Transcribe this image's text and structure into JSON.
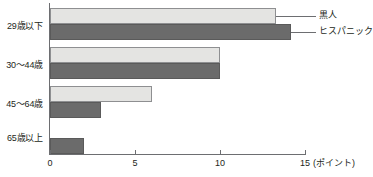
{
  "chart_data": {
    "type": "bar",
    "orientation": "horizontal",
    "title": "",
    "subtitle": "",
    "xlabel": "(ポイント)",
    "ylabel": "",
    "categories": [
      "29歳以下",
      "30～44歳",
      "45～64歳",
      "65歳以上"
    ],
    "series": [
      {
        "name": "黒人",
        "color": "#e4e4e2",
        "values": [
          13.3,
          10,
          6,
          0
        ]
      },
      {
        "name": "ヒスパニック",
        "color": "#6b6b6b",
        "values": [
          14.2,
          10,
          3,
          2
        ]
      }
    ],
    "xlim": [
      0,
      15
    ],
    "xticks": [
      0,
      5,
      10,
      15
    ],
    "xtick_labels": [
      "0",
      "5",
      "10",
      "15"
    ],
    "grid": false,
    "legend_position": "right-inline-callout",
    "annotations": []
  },
  "axis": {
    "unit_label": "(ポイント)"
  },
  "legend": {
    "items": [
      {
        "label": "黒人"
      },
      {
        "label": "ヒスパニック"
      }
    ]
  },
  "colors": {
    "series_light": "#e4e4e2",
    "series_dark": "#6b6b6b",
    "axis": "#6d6e71",
    "text": "#231f20",
    "background": "#ffffff"
  }
}
